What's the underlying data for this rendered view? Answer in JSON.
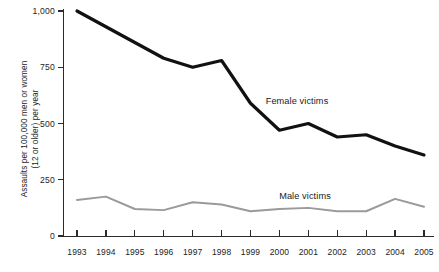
{
  "chart_data": {
    "type": "line",
    "title": "",
    "subtitle": "",
    "xlabel": "",
    "ylabel": "Assaults per 100,000 men or women\n(12 or older) per year",
    "ylabel_lines": [
      "Assaults per 100,000 men or women",
      "(12 or older) per year"
    ],
    "categories": [
      "1993",
      "1994",
      "1995",
      "1996",
      "1997",
      "1998",
      "1999",
      "2000",
      "2001",
      "2002",
      "2003",
      "2004",
      "2005"
    ],
    "x": [
      1993,
      1994,
      1995,
      1996,
      1997,
      1998,
      1999,
      2000,
      2001,
      2002,
      2003,
      2004,
      2005
    ],
    "xlim": [
      1993,
      2005
    ],
    "ylim": [
      0,
      1000
    ],
    "yticks": [
      0,
      250,
      500,
      750,
      1000
    ],
    "ytick_labels": [
      "0",
      "250",
      "500",
      "750",
      "1,000"
    ],
    "xtick_labels": [
      "1993",
      "1994",
      "1995",
      "1996",
      "1997",
      "1998",
      "1999",
      "2000",
      "2001",
      "2002",
      "2003",
      "2004",
      "2005"
    ],
    "grid": false,
    "legend_position": "inline-annotations",
    "series": [
      {
        "name": "Female victims",
        "color": "#111111",
        "line_width": 3.2,
        "values": [
          1000,
          930,
          860,
          790,
          750,
          780,
          590,
          470,
          500,
          440,
          450,
          400,
          360
        ]
      },
      {
        "name": "Male victims",
        "color": "#9a9a9a",
        "line_width": 2.0,
        "values": [
          160,
          175,
          120,
          115,
          150,
          140,
          110,
          120,
          125,
          110,
          110,
          165,
          130
        ]
      }
    ],
    "annotations": [
      {
        "text": "Female victims",
        "x": 2001.2,
        "y": 560
      },
      {
        "text": "Male victims",
        "x": 2001.5,
        "y": 210
      }
    ]
  },
  "axis": {
    "y_title_line1": "Assaults per 100,000 men or women",
    "y_title_line2": "(12 or older) per year"
  },
  "labels": {
    "female": "Female victims",
    "male": "Male victims"
  }
}
